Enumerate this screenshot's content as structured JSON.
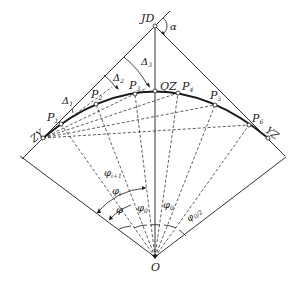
{
  "diagram": {
    "type": "circular-curve-deflection-angle-layout",
    "colors": {
      "line": "#1a1a1a",
      "background": "#ffffff"
    },
    "points": {
      "JD": {
        "label": "JD",
        "x": 155,
        "y": 26
      },
      "ZY": {
        "label": "ZY",
        "x": 43,
        "y": 138
      },
      "YZ": {
        "label": "YZ",
        "x": 268,
        "y": 138
      },
      "QZ": {
        "label": "QZ",
        "x": 155,
        "y": 91
      },
      "O": {
        "label": "O",
        "x": 155,
        "y": 257
      },
      "P1": {
        "label": "P",
        "sub": "1",
        "x": 61,
        "y": 124
      },
      "P2": {
        "label": "P",
        "sub": "2",
        "x": 96,
        "y": 104
      },
      "P3": {
        "label": "P",
        "sub": "3",
        "x": 135,
        "y": 94
      },
      "P4": {
        "label": "P",
        "sub": "4",
        "x": 178,
        "y": 93
      },
      "P5": {
        "label": "P",
        "sub": "5",
        "x": 215,
        "y": 105
      },
      "P6": {
        "label": "P",
        "sub": "6",
        "x": 249,
        "y": 125
      }
    },
    "angle_labels": {
      "alpha": "α",
      "delta1": {
        "main": "Δ",
        "sub": "1"
      },
      "delta2": {
        "main": "Δ",
        "sub": "2"
      },
      "delta3": {
        "main": "Δ",
        "sub": "3"
      },
      "phi_i_plus_1": {
        "main": "φ",
        "sub": "i+1"
      },
      "phi_i": {
        "main": "φ",
        "sub": "i"
      },
      "phi": {
        "main": "φ",
        "sub": ""
      },
      "phi0_left": {
        "main": "φ",
        "sub": "0"
      },
      "phi0_right": {
        "main": "φ",
        "sub": "0"
      },
      "phi0_over2": {
        "main": "φ",
        "sub": "0/2"
      }
    },
    "caption": ""
  }
}
